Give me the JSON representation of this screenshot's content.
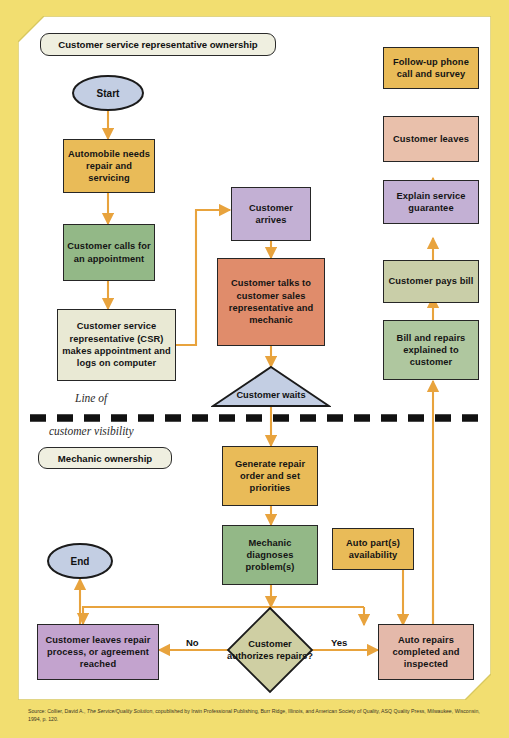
{
  "diagram": {
    "type": "flowchart",
    "bands": {
      "top_band_label": "Customer service representative ownership",
      "bottom_band_label": "Mechanic ownership",
      "visibility_line_label_1": "Line of",
      "visibility_line_label_2": "customer visibility"
    },
    "nodes": [
      {
        "id": "start",
        "label": "Start",
        "shape": "ellipse",
        "color": "#C3CEE3"
      },
      {
        "id": "auto_needs",
        "label": "Automobile needs repair and servicing",
        "shape": "rect",
        "color": "#E9BB58"
      },
      {
        "id": "cust_calls",
        "label": "Customer calls for an appointment",
        "shape": "rect",
        "color": "#93B887"
      },
      {
        "id": "csr_appt",
        "label": "Customer service representative (CSR) makes appointment and logs on computer",
        "shape": "rect",
        "color": "#E9E9D4"
      },
      {
        "id": "cust_arrives",
        "label": "Customer arrives",
        "shape": "rect",
        "color": "#C3B0D4"
      },
      {
        "id": "cust_talks",
        "label": "Customer talks to customer sales representative and mechanic",
        "shape": "rect",
        "color": "#E08C6B"
      },
      {
        "id": "cust_waits",
        "label": "Customer waits",
        "shape": "triangle",
        "color": "#C3CEE3"
      },
      {
        "id": "gen_repair",
        "label": "Generate repair order and set priorities",
        "shape": "rect",
        "color": "#E9BB58"
      },
      {
        "id": "mech_diag",
        "label": "Mechanic diagnoses problem(s)",
        "shape": "rect",
        "color": "#93B887"
      },
      {
        "id": "auto_parts",
        "label": "Auto part(s) availability",
        "shape": "rect",
        "color": "#E9BB58"
      },
      {
        "id": "cust_auth",
        "label": "Customer authorizes repairs?",
        "shape": "diamond",
        "color": "#CFCFA3"
      },
      {
        "id": "cust_leaves2",
        "label": "Customer leaves repair process, or agreement reached",
        "shape": "rect",
        "color": "#C3A3CE"
      },
      {
        "id": "auto_repairs",
        "label": "Auto repairs completed and inspected",
        "shape": "rect",
        "color": "#E4B9AA"
      },
      {
        "id": "end",
        "label": "End",
        "shape": "ellipse",
        "color": "#C3CEE3"
      },
      {
        "id": "bill_expl",
        "label": "Bill and repairs explained to customer",
        "shape": "rect",
        "color": "#AFC79F"
      },
      {
        "id": "cust_pays",
        "label": "Customer pays bill",
        "shape": "rect",
        "color": "#C9CEA8"
      },
      {
        "id": "expl_guar",
        "label": "Explain service guarantee",
        "shape": "rect",
        "color": "#C3B0D4"
      },
      {
        "id": "cust_leaves",
        "label": "Customer leaves",
        "shape": "rect",
        "color": "#E9C0AB"
      },
      {
        "id": "followup",
        "label": "Follow-up phone call and survey",
        "shape": "rect",
        "color": "#E9BB58"
      }
    ],
    "edge_labels": {
      "no": "No",
      "yes": "Yes"
    },
    "accent_color": "#E8A33D",
    "background_color": "#F2DE70"
  },
  "source": {
    "prefix": "Source: Collier, David A., ",
    "work": "The Service/Quality Solution",
    "rest": ", copublished by Irwin Professional Publishing, Burr Ridge, Illinois, and American Society of Quality, ASQ Quality Press, Milwaukee, Wisconsin, 1994, p. 120."
  }
}
